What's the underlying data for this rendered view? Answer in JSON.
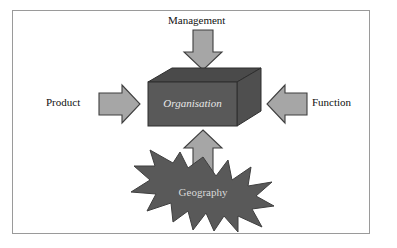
{
  "diagram": {
    "title_text": "",
    "center": {
      "label": "Organisation",
      "shape": "cuboid-3d-box",
      "fill_color": "#595959",
      "top_face_color": "#4a4a4a",
      "side_face_color": "#4f4f4f",
      "text_color": "#e8e8e8",
      "text_style": "italic"
    },
    "burst": {
      "label": "Geography",
      "shape": "explosion-star-burst",
      "fill_color": "#595959",
      "text_color": "#d8d8d8"
    },
    "inputs": [
      {
        "label": "Management",
        "position": "top",
        "arrow_direction": "down",
        "arrow_name": "arrow-down-management"
      },
      {
        "label": "Product",
        "position": "left",
        "arrow_direction": "right",
        "arrow_name": "arrow-right-product"
      },
      {
        "label": "Function",
        "position": "right",
        "arrow_direction": "left",
        "arrow_name": "arrow-left-function"
      },
      {
        "label": "Geography",
        "position": "bottom",
        "arrow_direction": "up",
        "arrow_name": "arrow-up-geography"
      }
    ],
    "colors": {
      "arrow_fill": "#a6a6a6",
      "arrow_stroke": "#3f3f3f",
      "shape_fill": "#595959",
      "frame_border": "#9a9a9a",
      "background": "#ffffff",
      "label_text": "#111111"
    }
  }
}
